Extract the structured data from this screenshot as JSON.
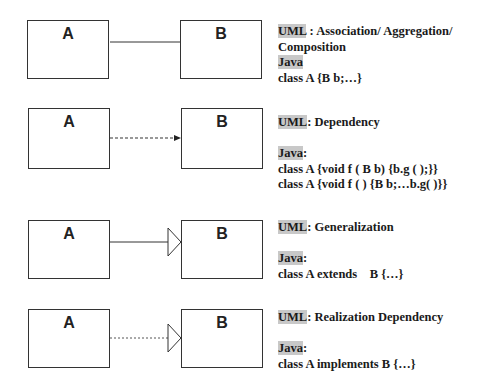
{
  "diagrams": [
    {
      "name": "association",
      "class_a": "A",
      "class_b": "B",
      "connector": "solid-line",
      "uml_tag": "UML",
      "uml_text": " : Association/ Aggregation/",
      "uml_text_cont": "Composition",
      "java_tag": "Java",
      "java_suffix": "",
      "code": [
        "class A {B b;…}"
      ]
    },
    {
      "name": "dependency",
      "class_a": "A",
      "class_b": "B",
      "connector": "dashed-arrow",
      "uml_tag": "UML",
      "uml_text": ": Dependency",
      "java_tag": "Java",
      "java_suffix": ":",
      "code": [
        "class A {void f ( B b) {b.g ( );}}",
        "class A {void f ( ) {B b;…b.g( )}}"
      ]
    },
    {
      "name": "generalization",
      "class_a": "A",
      "class_b": "B",
      "connector": "solid-line-hollow-triangle",
      "uml_tag": "UML",
      "uml_text": ": Generalization",
      "java_tag": "Java",
      "java_suffix": ":",
      "code": [
        "class A extends    B {…}"
      ]
    },
    {
      "name": "realization",
      "class_a": "A",
      "class_b": "B",
      "connector": "dotted-line-hollow-triangle",
      "uml_tag": "UML",
      "uml_text": ": Realization Dependency",
      "java_tag": "Java",
      "java_suffix": ":",
      "code": [
        "class A implements B {…}"
      ]
    }
  ],
  "colors": {
    "line": "#333333",
    "highlight": "#c8c8c8",
    "text": "#1a1a1a"
  }
}
